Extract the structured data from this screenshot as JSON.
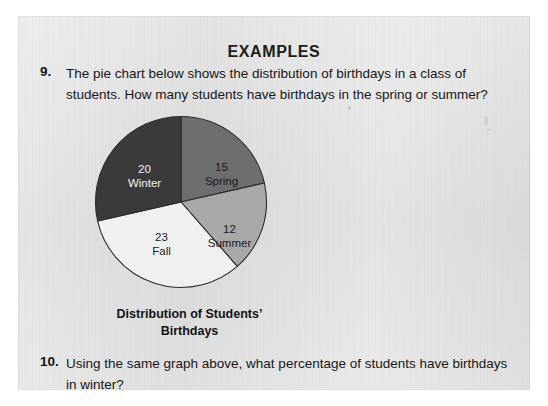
{
  "page": {
    "heading": "EXAMPLES",
    "background_color": "#dcdcdc",
    "paper_color": "#ffffff"
  },
  "questions": [
    {
      "number": "9.",
      "text": "The pie chart below shows the distribution of birthdays in a class of students. How many students have birthdays in the spring or summer?"
    },
    {
      "number": "10.",
      "text": "Using the same graph above, what percentage of students have birthdays in winter?"
    }
  ],
  "chart_data": {
    "type": "pie",
    "title_line1": "Distribution of Students’",
    "title_line2": "Birthdays",
    "categories": [
      "Spring",
      "Summer",
      "Fall",
      "Winter"
    ],
    "values": [
      15,
      12,
      23,
      20
    ],
    "total": 70,
    "start_angle_deg": 0,
    "direction": "clockwise",
    "legend": "none",
    "labels_inside": true,
    "slices": [
      {
        "name": "Spring",
        "value": 15,
        "color": "#6e6e6e",
        "label_color": "#1b1b1b",
        "percent": 21.4
      },
      {
        "name": "Summer",
        "value": 12,
        "color": "#a8a8a8",
        "label_color": "#1b1b1b",
        "percent": 17.1
      },
      {
        "name": "Fall",
        "value": 23,
        "color": "#f0f0f0",
        "label_color": "#1b1b1b",
        "percent": 32.9
      },
      {
        "name": "Winter",
        "value": 20,
        "color": "#3a3a3a",
        "label_color": "#f4f4f4",
        "percent": 28.6
      }
    ],
    "outline_color": "#2b2b2b"
  }
}
